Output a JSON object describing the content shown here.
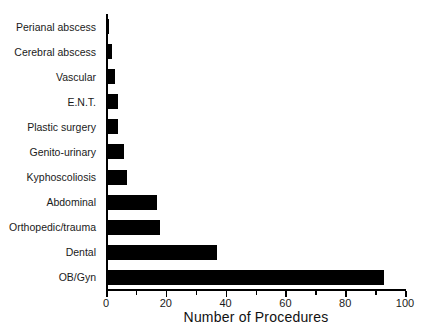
{
  "chart_data": {
    "type": "bar",
    "orientation": "horizontal",
    "title": "",
    "xlabel": "Number of Procedures",
    "ylabel": "",
    "xlim": [
      0,
      100
    ],
    "xticks": [
      0,
      20,
      40,
      60,
      80,
      100
    ],
    "xticklabels": [
      "0",
      "20",
      "40",
      "60",
      "80",
      "100"
    ],
    "minor_xticks": [
      10,
      30,
      50,
      70,
      90
    ],
    "grid": false,
    "legend": null,
    "bar_color": "#000000",
    "categories": [
      "Perianal abscess",
      "Cerebral abscess",
      "Vascular",
      "E.N.T.",
      "Plastic surgery",
      "Genito-urinary",
      "Kyphoscoliosis",
      "Abdominal",
      "Orthopedic/trauma",
      "Dental",
      "OB/Gyn"
    ],
    "values": [
      1,
      2,
      3,
      4,
      4,
      6,
      7,
      17,
      18,
      37,
      93
    ]
  }
}
